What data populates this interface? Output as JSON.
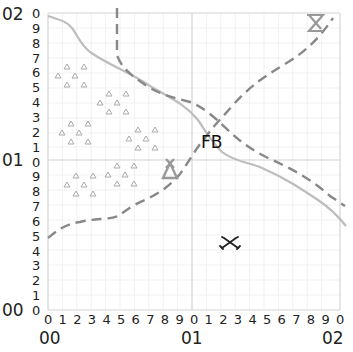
{
  "grid": {
    "x_major_labels": [
      "00",
      "01",
      "02"
    ],
    "y_major_labels": [
      "00",
      "01",
      "02"
    ],
    "x_minor_labels": [
      "0",
      "1",
      "2",
      "3",
      "4",
      "5",
      "6",
      "7",
      "8",
      "9",
      "0",
      "1",
      "2",
      "3",
      "4",
      "5",
      "6",
      "7",
      "8",
      "9",
      "0"
    ],
    "y_minor_labels": [
      "0",
      "9",
      "8",
      "7",
      "6",
      "5",
      "4",
      "3",
      "2",
      "1",
      "0",
      "9",
      "8",
      "7",
      "6",
      "5",
      "4",
      "3",
      "2",
      "1",
      "0"
    ]
  },
  "features": {
    "label_fb": "FB",
    "icons": [
      {
        "name": "camp-tent-icon",
        "x": 170,
        "y": 170
      },
      {
        "name": "hourglass-objective-icon",
        "x": 315,
        "y": 22
      },
      {
        "name": "crossed-swords-icon",
        "x": 230,
        "y": 244
      }
    ],
    "forest_clusters": [
      {
        "x": 75,
        "y": 76
      },
      {
        "x": 117,
        "y": 105
      },
      {
        "x": 80,
        "y": 138
      },
      {
        "x": 146,
        "y": 140
      },
      {
        "x": 84,
        "y": 182
      },
      {
        "x": 122,
        "y": 175
      }
    ]
  },
  "colors": {
    "grid": "#dddddd",
    "major_grid": "#cccccc",
    "line_solid": "#bdbdbd",
    "line_dashed": "#888888",
    "icon": "#888888",
    "text": "#222222"
  }
}
